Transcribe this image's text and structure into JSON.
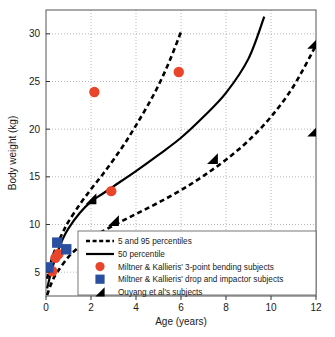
{
  "chart_data": {
    "type": "scatter",
    "title": "",
    "xlabel": "Age (years)",
    "ylabel": "Body weight (kg)",
    "xlim": [
      0,
      12
    ],
    "ylim": [
      2.5,
      32.5
    ],
    "xticks": [
      0,
      2,
      4,
      6,
      8,
      10,
      12
    ],
    "yticks": [
      5,
      10,
      15,
      20,
      25,
      30
    ],
    "grid": true,
    "legend_position": "lower-right-inside",
    "series": [
      {
        "name": "5 and 95 percentiles",
        "type": "line",
        "style": "dashed",
        "color": "#000000",
        "curves": [
          {
            "name": "95th percentile",
            "x": [
              0.05,
              0.25,
              0.5,
              0.75,
              1.0,
              1.5,
              2.0,
              2.5,
              3.0,
              3.5,
              4.0,
              4.5,
              5.0,
              5.5,
              6.0
            ],
            "y": [
              4.3,
              6.3,
              7.9,
              9.2,
              10.3,
              12.1,
              13.7,
              15.2,
              16.8,
              18.5,
              20.4,
              22.4,
              24.6,
              27.2,
              30.2
            ]
          },
          {
            "name": "5th percentile",
            "x": [
              0.05,
              0.25,
              0.5,
              1.0,
              1.5,
              2.0,
              3.0,
              4.0,
              5.0,
              6.0,
              7.0,
              8.0,
              9.0,
              10.0,
              11.0,
              12.0
            ],
            "y": [
              2.6,
              3.9,
              5.0,
              6.6,
              7.7,
              8.6,
              9.9,
              11.1,
              12.3,
              13.6,
              15.1,
              16.8,
              18.8,
              21.3,
              24.5,
              28.8
            ]
          }
        ]
      },
      {
        "name": "50 percentile",
        "type": "line",
        "style": "solid",
        "color": "#000000",
        "curves": [
          {
            "name": "50th percentile",
            "x": [
              0.05,
              0.25,
              0.5,
              0.75,
              1.0,
              1.5,
              2.0,
              2.5,
              3.0,
              4.0,
              5.0,
              6.0,
              7.0,
              8.0,
              9.0,
              9.7
            ],
            "y": [
              3.3,
              5.2,
              7.0,
              8.5,
              9.6,
              11.2,
              12.4,
              13.2,
              14.0,
              15.6,
              17.3,
              19.1,
              21.3,
              23.8,
              27.4,
              31.8
            ]
          }
        ]
      },
      {
        "name": "Miltner & Kallieris' 3-point bending subjects",
        "type": "scatter",
        "marker": "circle",
        "color": "#E8452A",
        "points": [
          {
            "x": 0.28,
            "y": 5.1
          },
          {
            "x": 0.42,
            "y": 6.5
          },
          {
            "x": 0.55,
            "y": 6.9
          },
          {
            "x": 2.15,
            "y": 23.9
          },
          {
            "x": 2.9,
            "y": 13.5
          },
          {
            "x": 5.9,
            "y": 26.0
          }
        ]
      },
      {
        "name": "Miltner & Kallieris' drop and impactor subjects",
        "type": "scatter",
        "marker": "square",
        "color": "#2B4FA0",
        "points": [
          {
            "x": 0.1,
            "y": 5.5
          },
          {
            "x": 0.5,
            "y": 8.1
          },
          {
            "x": 0.9,
            "y": 7.4
          }
        ]
      },
      {
        "name": "Ouyang et al's subjects",
        "type": "scatter",
        "marker": "triangle",
        "color": "#000000",
        "points": [
          {
            "x": 2.0,
            "y": 12.7
          },
          {
            "x": 3.0,
            "y": 10.4
          },
          {
            "x": 7.4,
            "y": 16.9
          },
          {
            "x": 11.85,
            "y": 19.8
          },
          {
            "x": 11.85,
            "y": 29.0
          }
        ]
      }
    ],
    "legend_entries": [
      {
        "label": "5 and 95 percentiles",
        "marker": "dashed-line",
        "color": "#000000"
      },
      {
        "label": "50 percentile",
        "marker": "solid-line",
        "color": "#000000"
      },
      {
        "label": "Miltner & Kallieris' 3-point bending subjects",
        "marker": "circle",
        "color": "#E8452A"
      },
      {
        "label": "Miltner & Kallieris' drop and impactor subjects",
        "marker": "square",
        "color": "#2B4FA0"
      },
      {
        "label": "Ouyang et al's subjects",
        "marker": "triangle",
        "color": "#000000"
      }
    ]
  }
}
